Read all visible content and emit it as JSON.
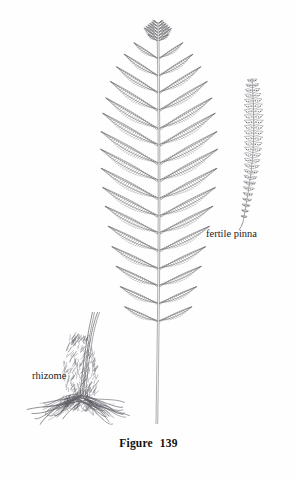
{
  "figure": {
    "caption_word": "Figure",
    "caption_number": "139",
    "medium": "pen-and-ink line engraving",
    "ink_color": "#6a6a6e",
    "background_color": "#fefefe",
    "page_header_text": ""
  },
  "labels": {
    "fertile_pinna": "fertile pinna",
    "rhizome": "rhizome",
    "signature": "scr"
  },
  "parts": {
    "frond": {
      "name": "sterile-frond",
      "rachis_x": 158,
      "apex_y": 22,
      "base_y": 425,
      "lowest_pinna_y": 320,
      "pinna_pairs": 17,
      "max_half_width": 62
    },
    "fertile_pinna": {
      "name": "fertile-pinna",
      "tip_x": 252,
      "tip_y": 78,
      "base_x": 243,
      "base_y": 222,
      "pinnule_pairs": 26
    },
    "rhizome": {
      "name": "rhizome-with-roots",
      "center_x": 78,
      "crown_top_y": 338,
      "crown_bottom_y": 400,
      "root_spread_left": 22,
      "root_spread_right": 118,
      "root_bottom_y": 428
    }
  }
}
